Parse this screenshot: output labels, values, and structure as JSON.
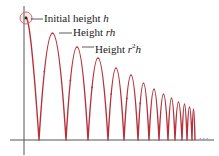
{
  "diagram": {
    "colors": {
      "curve": "#b5323c",
      "axis": "#555555",
      "highlight_circle": "#c9707a",
      "text": "#1a1a1a"
    },
    "axes": {
      "origin_x": 24,
      "ground_y": 140,
      "x_start": 10,
      "x_end": 214,
      "y_top": 6,
      "y_bottom": 155
    },
    "start_point": {
      "x": 26,
      "y": 18,
      "circle_radius": 6
    },
    "ground_hits_x": [
      39,
      66,
      88,
      108,
      124,
      138,
      149,
      159,
      168,
      175,
      182,
      187,
      192,
      195
    ],
    "peak_heights_y": [
      33,
      47,
      58,
      68,
      75,
      83,
      89,
      94,
      98,
      102,
      104,
      107,
      109
    ],
    "labels": [
      {
        "id": "initial",
        "prefix": "Initial height ",
        "var": "h",
        "sup": "",
        "suffix": "",
        "leader_from_x": 31,
        "leader_to_x": 43,
        "y": 19,
        "text_x": 44
      },
      {
        "id": "rh",
        "prefix": "Height ",
        "var": "rh",
        "sup": "",
        "suffix": "",
        "leader_from_x": 59,
        "leader_to_x": 72,
        "y": 33,
        "text_x": 73
      },
      {
        "id": "r2h",
        "prefix": "Height ",
        "var": "r",
        "sup": "2",
        "suffix": "h",
        "leader_from_x": 82,
        "leader_to_x": 94,
        "y": 47,
        "text_x": 95
      }
    ],
    "continuation": "..."
  }
}
